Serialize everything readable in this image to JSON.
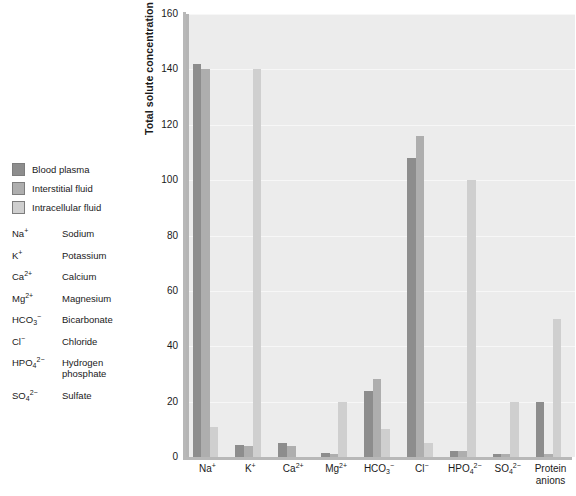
{
  "legend": {
    "items": [
      {
        "label": "Blood plasma",
        "color": "#8d8d8d",
        "key": "blood_plasma"
      },
      {
        "label": "Interstitial fluid",
        "color": "#aeaeae",
        "key": "interstitial_fluid"
      },
      {
        "label": "Intracellular fluid",
        "color": "#cfcfcf",
        "key": "intracellular_fluid"
      }
    ]
  },
  "abbreviations": [
    {
      "symbol_html": "Na<sup>+</sup>",
      "name": "Sodium",
      "name2": ""
    },
    {
      "symbol_html": "K<sup>+</sup>",
      "name": "Potassium",
      "name2": ""
    },
    {
      "symbol_html": "Ca<sup>2+</sup>",
      "name": "Calcium",
      "name2": ""
    },
    {
      "symbol_html": "Mg<sup>2+</sup>",
      "name": "Magnesium",
      "name2": ""
    },
    {
      "symbol_html": "HCO<sub>3</sub><sup>&#8722;</sup>",
      "name": "Bicarbonate",
      "name2": ""
    },
    {
      "symbol_html": "Cl<sup>&#8722;</sup>",
      "name": "Chloride",
      "name2": ""
    },
    {
      "symbol_html": "HPO<sub>4</sub><sup>2&#8722;</sup>",
      "name": "Hydrogen",
      "name2": "phosphate"
    },
    {
      "symbol_html": "SO<sub>4</sub><sup>2&#8722;</sup>",
      "name": "Sulfate",
      "name2": ""
    }
  ],
  "chart_data": {
    "type": "bar",
    "title": "",
    "xlabel": "",
    "ylabel": "Total solute concentration (mEq/L)",
    "ylim": [
      0,
      160
    ],
    "yticks": [
      0,
      20,
      40,
      60,
      80,
      100,
      120,
      140,
      160
    ],
    "grid": true,
    "legend_position": "outside-left",
    "categories": [
      "Na+",
      "K+",
      "Ca2+",
      "Mg2+",
      "HCO3-",
      "Cl-",
      "HPO4 2-",
      "SO4 2-",
      "Protein anions"
    ],
    "category_labels_html": [
      "Na<sup>+</sup>",
      "K<sup>+</sup>",
      "Ca<sup>2+</sup>",
      "Mg<sup>2+</sup>",
      "HCO<sub>3</sub><sup>&#8722;</sup>",
      "Cl<sup>&#8722;</sup>",
      "HPO<sub>4</sub><sup>2&#8722;</sup>",
      "SO<sub>4</sub><sup>2&#8722;</sup>",
      "Protein|anions"
    ],
    "series": [
      {
        "name": "Blood plasma",
        "color": "#8d8d8d",
        "values": [
          142,
          4.2,
          5,
          1.5,
          24,
          108,
          2,
          1,
          20
        ]
      },
      {
        "name": "Interstitial fluid",
        "color": "#aeaeae",
        "values": [
          140,
          4.0,
          4,
          1.0,
          28,
          116,
          2,
          1,
          1
        ]
      },
      {
        "name": "Intracellular fluid",
        "color": "#cfcfcf",
        "values": [
          11,
          140,
          0,
          20,
          10,
          5,
          100,
          20,
          50
        ]
      }
    ],
    "units": "mEq/L",
    "plot_background": "#ececec",
    "axis_color": "#b8b8b8",
    "gridline_color": "#f7f7f7"
  }
}
